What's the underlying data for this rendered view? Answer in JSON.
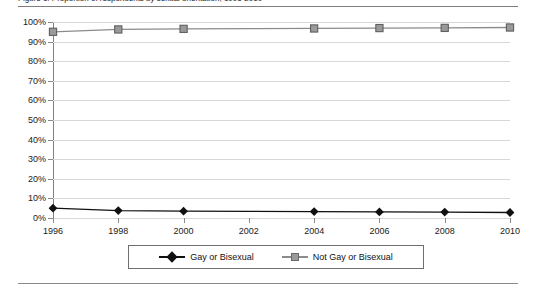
{
  "figure": {
    "caption": "Figure 1. Proportion of respondents by sexual orientation, 1996-2010"
  },
  "chart_data": {
    "type": "line",
    "title": "",
    "xlabel": "",
    "ylabel": "",
    "x": [
      1996,
      1998,
      2000,
      2002,
      2004,
      2006,
      2008,
      2010
    ],
    "tick_labels_x": [
      "1996",
      "1998",
      "2000",
      "2002",
      "2004",
      "2006",
      "2008",
      "2010"
    ],
    "tick_labels_y": [
      "0%",
      "10%",
      "20%",
      "30%",
      "40%",
      "50%",
      "60%",
      "70%",
      "80%",
      "90%",
      "100%"
    ],
    "ylim": [
      0,
      100
    ],
    "xlim": [
      1996,
      2010
    ],
    "y_tick_step": 10,
    "grid": "horizontal",
    "legend_position": "bottom",
    "marker_years": [
      1996,
      1998,
      2000,
      2004,
      2006,
      2008,
      2010
    ],
    "series": [
      {
        "name": "Gay or Bisexual",
        "marker": "diamond",
        "color": "#111111",
        "values": [
          5.0,
          3.8,
          3.5,
          3.4,
          3.3,
          3.1,
          3.0,
          2.8
        ]
      },
      {
        "name": "Not Gay or Bisexual",
        "marker": "square",
        "color": "#8c8c8c",
        "values": [
          95.0,
          96.2,
          96.5,
          96.6,
          96.7,
          96.9,
          97.0,
          97.2
        ]
      }
    ]
  },
  "legend": {
    "items": [
      {
        "label": "Gay or Bisexual"
      },
      {
        "label": "Not Gay or Bisexual"
      }
    ]
  },
  "colors": {
    "series_gay": "#111111",
    "series_not_gay": "#8c8c8c",
    "grid": "#d8d8d8",
    "axis": "#808080",
    "rule": "#7d7d7d"
  }
}
